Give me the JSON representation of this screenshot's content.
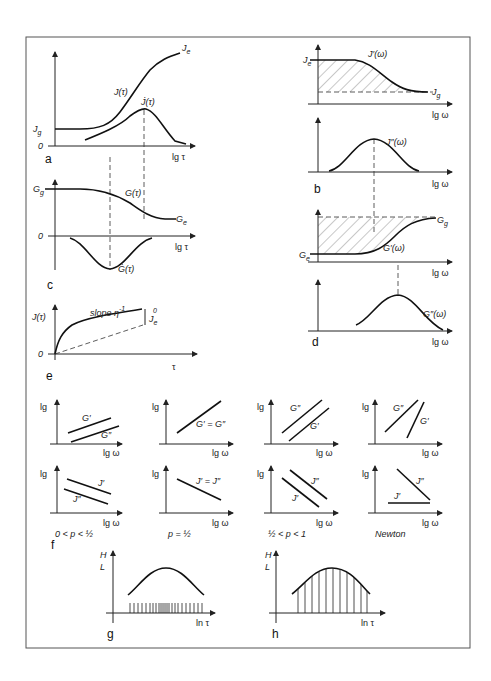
{
  "figure": {
    "panels": {
      "a": {
        "letter": "a",
        "xlabel": "lg τ",
        "zero": "0",
        "Jg": "J",
        "Jg_sub": "g",
        "Je": "J",
        "Je_sub": "e",
        "curve1": "J(τ)",
        "curve2": "J̇(τ)"
      },
      "b": {
        "letter": "b",
        "xlabel_top": "lg ω",
        "xlabel_bottom": "lg ω",
        "Je": "J",
        "Je_sub": "e",
        "Jg": "J",
        "Jg_sub": "g",
        "curve_top": "J′(ω)",
        "curve_bottom": "J″(ω)"
      },
      "c": {
        "letter": "c",
        "xlabel": "lg τ",
        "zero": "0",
        "Gg": "G",
        "Gg_sub": "g",
        "Ge": "G",
        "Ge_sub": "e",
        "curve1": "G(τ)",
        "curve2": "Ġ(τ)"
      },
      "d": {
        "letter": "d",
        "xlabel_top": "lg ω",
        "xlabel_bottom": "lg ω",
        "Gg": "G",
        "Gg_sub": "g",
        "Ge": "G",
        "Ge_sub": "e",
        "curve_top": "G′(ω)",
        "curve_bottom": "G″(ω)"
      },
      "e": {
        "letter": "e",
        "xlabel": "τ",
        "ylabel": "J(τ)",
        "zero": "0",
        "slope": "slope η",
        "slope_sup": "-1",
        "Je0": "J",
        "Je0_sub": "e",
        "Je0_sup": "0"
      },
      "f": {
        "letter": "f",
        "ylabel": "lg",
        "xlabel": "lg ω",
        "conditions": [
          "0 < p < ½",
          "p = ½",
          "½ < p < 1",
          "Newton"
        ],
        "top_labels": [
          [
            "G′",
            "G″"
          ],
          [
            "G′ = G″"
          ],
          [
            "G″",
            "G′"
          ],
          [
            "G″",
            "G′"
          ]
        ],
        "bottom_labels": [
          [
            "J′",
            "J″"
          ],
          [
            "J′ = J″"
          ],
          [
            "J″",
            "J′"
          ],
          [
            "J″",
            "J′"
          ]
        ]
      },
      "g": {
        "letter": "g",
        "ylabel_top": "H",
        "ylabel_bottom": "L",
        "xlabel": "ln τ"
      },
      "h": {
        "letter": "h",
        "ylabel_top": "H",
        "ylabel_bottom": "L",
        "xlabel": "ln τ"
      }
    }
  }
}
